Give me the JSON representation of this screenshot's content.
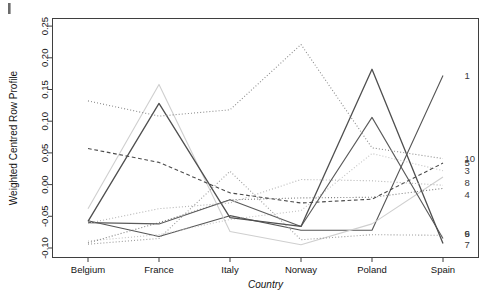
{
  "figure": {
    "corner_mark": "|",
    "background": "#ffffff"
  },
  "chart_data": {
    "type": "line",
    "title": "",
    "subtitle": "",
    "xlabel": "Country",
    "ylabel": "Weighted Centred Row Profile",
    "categories": [
      "Belgium",
      "France",
      "Italy",
      "Norway",
      "Poland",
      "Spain"
    ],
    "x_tick_labels": [
      "Belgium",
      "France",
      "Italy",
      "Norway",
      "Poland",
      "Spain"
    ],
    "y_tick_labels": [
      "-0.10",
      "-0.05",
      "0.00",
      "0.05",
      "0.10",
      "0.15",
      "0.20",
      "0.25"
    ],
    "y_tick_values": [
      -0.1,
      -0.05,
      0.0,
      0.05,
      0.1,
      0.15,
      0.2,
      0.25
    ],
    "ylim": [
      -0.115,
      0.262
    ],
    "xlim": [
      0,
      5
    ],
    "grid": false,
    "legend_position": "right-inline-endpoint-labels",
    "series": [
      {
        "name": "1",
        "label": "1",
        "color": "#555555",
        "dash": "solid",
        "width": 1.1,
        "values": [
          -0.057,
          -0.082,
          -0.049,
          -0.072,
          -0.072,
          0.172
        ]
      },
      {
        "name": "2",
        "label": "2",
        "color": "#cfcfcf",
        "dash": "solid",
        "width": 1.1,
        "values": [
          -0.038,
          0.158,
          -0.074,
          -0.095,
          -0.062,
          0.012
        ]
      },
      {
        "name": "3",
        "label": "3",
        "color": "#c2c2c2",
        "dash": "dotted",
        "width": 1.1,
        "values": [
          -0.089,
          -0.079,
          -0.055,
          -0.041,
          0.049,
          0.022
        ]
      },
      {
        "name": "4",
        "label": "4",
        "color": "#7d7d7d",
        "dash": "dotted",
        "width": 1.1,
        "values": [
          -0.092,
          -0.06,
          -0.024,
          -0.021,
          -0.02,
          -0.006
        ]
      },
      {
        "name": "5",
        "label": "5",
        "color": "#4a4a4a",
        "dash": "dashed",
        "width": 1.1,
        "values": [
          0.057,
          0.035,
          -0.013,
          -0.029,
          -0.023,
          0.034
        ]
      },
      {
        "name": "6",
        "label": "6",
        "color": "#5a5a5a",
        "dash": "solid",
        "width": 1.1,
        "values": [
          -0.06,
          -0.062,
          -0.024,
          -0.066,
          0.106,
          -0.085
        ]
      },
      {
        "name": "7",
        "label": "7",
        "color": "#4f4f4f",
        "dash": "solid",
        "width": 1.3,
        "values": [
          -0.058,
          0.128,
          -0.052,
          -0.066,
          0.182,
          -0.093
        ]
      },
      {
        "name": "8",
        "label": "8",
        "color": "#b4b4b4",
        "dash": "dotted",
        "width": 1.1,
        "values": [
          -0.061,
          -0.038,
          -0.029,
          0.008,
          0.006,
          -0.001
        ]
      },
      {
        "name": "9",
        "label": "9",
        "color": "#9a9a9a",
        "dash": "dotted",
        "width": 1.1,
        "values": [
          -0.094,
          -0.085,
          0.021,
          -0.087,
          -0.079,
          -0.08
        ]
      },
      {
        "name": "10",
        "label": "10",
        "color": "#8c8c8c",
        "dash": "dotted",
        "width": 1.1,
        "values": [
          0.132,
          0.108,
          0.118,
          0.221,
          0.058,
          0.041
        ]
      }
    ],
    "endpoint_labels": [
      {
        "text": "1",
        "value": 0.172
      },
      {
        "text": "10",
        "value": 0.041
      },
      {
        "text": "5",
        "value": 0.034
      },
      {
        "text": "3",
        "value": 0.022
      },
      {
        "text": "8",
        "value": 0.003
      },
      {
        "text": "4",
        "value": -0.016
      },
      {
        "text": "6",
        "value": -0.078
      },
      {
        "text": "9",
        "value": -0.078
      },
      {
        "text": "7",
        "value": -0.095
      }
    ]
  }
}
